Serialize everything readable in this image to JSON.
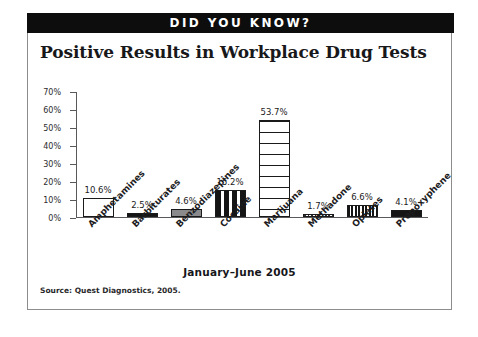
{
  "banner": {
    "text": "DID YOU KNOW?"
  },
  "footer": {
    "period": "January–June 2005",
    "source": "Source: Quest Diagnostics, 2005."
  },
  "colors": {
    "banner_background": "#0d0d0d",
    "banner_text": "#ffffff",
    "frame_border": "#8d8d8d",
    "axis": "#59595b",
    "bar_outline": "#1a1a1a",
    "page_background": "#ffffff"
  },
  "chart_data": {
    "type": "bar",
    "title": "Positive Results in Workplace Drug Tests",
    "xlabel": "",
    "ylabel": "",
    "ylim": [
      0,
      70
    ],
    "grid": false,
    "legend": "none",
    "ytick_labels": [
      "70%",
      "60%",
      "50%",
      "40%",
      "30%",
      "20%",
      "10%",
      "0%"
    ],
    "ytick_values": [
      70,
      60,
      50,
      40,
      30,
      20,
      10,
      0
    ],
    "categories": [
      "Amphetamines",
      "Barbiturates",
      "Benzodiazepines",
      "Cocaine",
      "Marijuana",
      "Methadone",
      "Opiates",
      "Propoxyphene"
    ],
    "values": [
      10.6,
      2.5,
      4.6,
      15.2,
      53.7,
      1.7,
      6.6,
      4.1
    ],
    "value_labels": [
      "10.6%",
      "2.5%",
      "4.6%",
      "15.2%",
      "53.7%",
      "1.7%",
      "6.6%",
      "4.1%"
    ],
    "bar_fills": [
      "white",
      "black",
      "gray",
      "vstripe-wide",
      "hstripe",
      "dotted",
      "vstripe-fine",
      "black"
    ]
  }
}
